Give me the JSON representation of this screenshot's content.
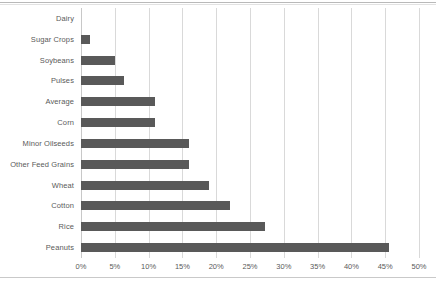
{
  "chart_data": {
    "type": "bar",
    "orientation": "horizontal",
    "title": "",
    "xlabel": "",
    "ylabel": "",
    "xlim": [
      0,
      50
    ],
    "xtick_labels": [
      "0%",
      "5%",
      "10%",
      "15%",
      "20%",
      "25%",
      "30%",
      "35%",
      "40%",
      "45%",
      "50%"
    ],
    "xtick_values": [
      0,
      5,
      10,
      15,
      20,
      25,
      30,
      35,
      40,
      45,
      50
    ],
    "grid": "vertical",
    "legend": "none",
    "categories": [
      "Dairy",
      "Sugar Crops",
      "Soybeans",
      "Pulses",
      "Average",
      "Corn",
      "Minor Oilseeds",
      "Other Feed Grains",
      "Wheat",
      "Cotton",
      "Rice",
      "Peanuts"
    ],
    "values": [
      0,
      1.3,
      5.0,
      6.3,
      11.0,
      11.0,
      16.0,
      16.0,
      19.0,
      22.0,
      27.2,
      45.5
    ],
    "value_unit": "%",
    "bar_color": "#595959",
    "gridline_color": "#d9d9d9",
    "background_color": "#ffffff"
  }
}
